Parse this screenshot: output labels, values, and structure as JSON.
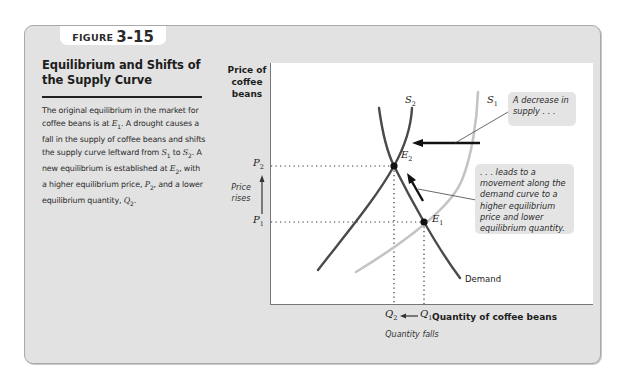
{
  "figure": {
    "label_word": "FIGURE",
    "label_number": "3-15",
    "title": "Equilibrium and Shifts of the Supply Curve",
    "description": {
      "p1": "The original equilibrium in the market for coffee beans is at ",
      "e1": "E",
      "e1_sub": "1",
      "p2": ". A drought causes a fall in the supply of coffee beans and shifts the supply curve leftward from ",
      "s1": "S",
      "s1_sub": "1",
      "p3": " to ",
      "s2": "S",
      "s2_sub": "2",
      "p4": ". A new equilibrium is established at ",
      "e2": "E",
      "e2_sub": "2",
      "p5": ", with a higher equilibrium price, ",
      "pr2": "P",
      "pr2_sub": "2",
      "p6": ", and a lower equilibrium quantity, ",
      "q2": "Q",
      "q2_sub": "2",
      "p7": "."
    }
  },
  "diagram": {
    "y_axis_label": "Price of coffee beans",
    "x_axis_label": "Quantity of coffee beans",
    "y_ticks": [
      {
        "label": "P",
        "sub": "2"
      },
      {
        "label": "P",
        "sub": "1"
      }
    ],
    "x_ticks": [
      {
        "label": "Q",
        "sub": "2"
      },
      {
        "label": "Q",
        "sub": "1"
      }
    ],
    "price_change_note": "Price rises",
    "quantity_change_note": "Quantity falls",
    "curves": {
      "s1": {
        "label": "S",
        "sub": "1",
        "color": "#c4c4c4"
      },
      "s2": {
        "label": "S",
        "sub": "2",
        "color": "#4a4a4a"
      },
      "demand": {
        "label": "Demand",
        "color": "#4a4a4a"
      }
    },
    "points": {
      "e1": {
        "label": "E",
        "sub": "1"
      },
      "e2": {
        "label": "E",
        "sub": "2"
      }
    },
    "callouts": {
      "supply_decrease": "A decrease in supply . . .",
      "movement": ". . . leads to a movement along the demand curve to a higher equilibrium price and lower equilibrium quantity."
    }
  },
  "colors": {
    "frame_bg": "#e2e2e2",
    "plot_bg": "#ffffff",
    "dark_curve": "#4a4a4a",
    "light_curve": "#c4c4c4",
    "callout_bg": "#e4e4e4"
  }
}
